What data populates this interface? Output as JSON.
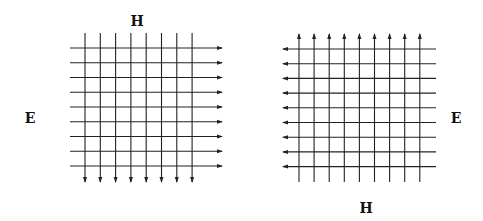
{
  "diagram": {
    "panels": [
      {
        "id": "left",
        "labels": {
          "top": "H",
          "side": "E"
        },
        "e_field": {
          "count": 9,
          "orientation": "horizontal",
          "arrow_direction": "right"
        },
        "h_field": {
          "count": 8,
          "orientation": "vertical",
          "arrow_direction": "down"
        }
      },
      {
        "id": "right",
        "labels": {
          "bottom": "H",
          "side": "E"
        },
        "e_field": {
          "count": 9,
          "orientation": "horizontal",
          "arrow_direction": "left"
        },
        "h_field": {
          "count": 9,
          "orientation": "vertical",
          "arrow_direction": "up"
        }
      }
    ],
    "line_color": "#222222"
  }
}
